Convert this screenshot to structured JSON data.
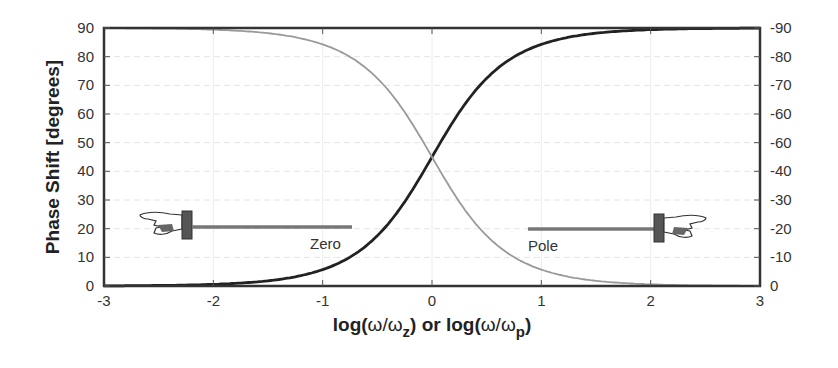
{
  "chart_data": {
    "type": "line",
    "title": "",
    "xlabel": "log(ω/ωz) or log(ω/ωp)",
    "xlabel_parts": {
      "a": "log(",
      "w1": "ω/ω",
      "sub1": "z",
      "mid": ") or log(",
      "w2": "ω/ω",
      "sub2": "p",
      "end": ")"
    },
    "ylabel": "Phase Shift [degrees]",
    "xlim": [
      -3,
      3
    ],
    "ylim": [
      0,
      90
    ],
    "y2lim": [
      -90,
      0
    ],
    "x_ticks": [
      "-3",
      "-2",
      "-1",
      "0",
      "1",
      "2",
      "3"
    ],
    "y_ticks": [
      "0",
      "10",
      "20",
      "30",
      "40",
      "50",
      "60",
      "70",
      "80",
      "90"
    ],
    "y2_ticks": [
      "0",
      "-10",
      "-20",
      "-30",
      "-40",
      "-60",
      "-60",
      "-70",
      "-80",
      "-90"
    ],
    "grid": true,
    "series": [
      {
        "name": "Zero",
        "color": "#222222",
        "x": [
          -3,
          -2.5,
          -2,
          -1.5,
          -1,
          -0.5,
          0,
          0.5,
          1,
          1.5,
          2,
          2.5,
          3
        ],
        "values": [
          0.1,
          0.2,
          0.6,
          1.8,
          5.7,
          17.5,
          45,
          72.5,
          84.3,
          88.2,
          89.4,
          89.8,
          89.9
        ]
      },
      {
        "name": "Pole",
        "color": "#999999",
        "x": [
          -3,
          -2.5,
          -2,
          -1.5,
          -1,
          -0.5,
          0,
          0.5,
          1,
          1.5,
          2,
          2.5,
          3
        ],
        "values": [
          89.9,
          89.8,
          89.4,
          88.2,
          84.3,
          72.5,
          45,
          17.5,
          5.7,
          1.8,
          0.6,
          0.2,
          0.1
        ]
      }
    ],
    "annotations": [
      {
        "text": "Zero",
        "x": -0.75,
        "y": 20,
        "pointer": "hand-pointing-left"
      },
      {
        "text": "Pole",
        "x": 0.85,
        "y": 20,
        "pointer": "hand-pointing-right"
      }
    ]
  }
}
